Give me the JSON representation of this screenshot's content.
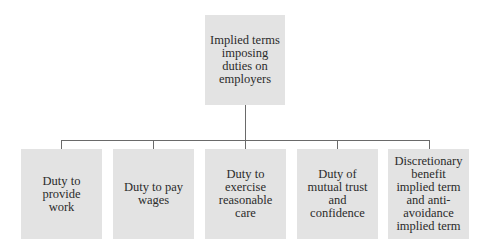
{
  "diagram": {
    "root": {
      "label": "Implied terms imposing duties on employers"
    },
    "children": [
      {
        "label": "Duty to provide work"
      },
      {
        "label": "Duty to pay wages"
      },
      {
        "label": "Duty to exercise reasonable care"
      },
      {
        "label": "Duty of mutual trust and confidence"
      },
      {
        "label": "Discretionary benefit implied term and anti-avoidance implied term"
      }
    ],
    "colors": {
      "box_fill": "#e3e3e3",
      "connector": "#6a6a6a",
      "text": "#2b2b2b"
    }
  }
}
